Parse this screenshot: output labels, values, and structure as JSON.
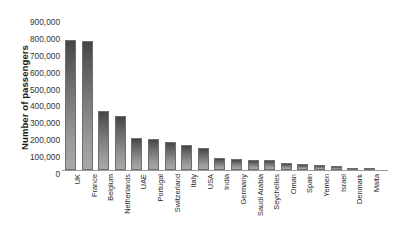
{
  "chart_data": {
    "type": "bar",
    "title": "",
    "xlabel": "",
    "ylabel": "Number of passengers",
    "ylim": [
      0,
      900000
    ],
    "grid": false,
    "legend": false,
    "y_ticks": [
      "0",
      "100,000",
      "200,000",
      "300,000",
      "400,000",
      "500,000",
      "600,000",
      "700,000",
      "800,000",
      "900,000"
    ],
    "y_tick_values": [
      0,
      100000,
      200000,
      300000,
      400000,
      500000,
      600000,
      700000,
      800000,
      900000
    ],
    "categories": [
      "UK",
      "France",
      "Belgium",
      "Netherlands",
      "UAE",
      "Portugal",
      "Switzerland",
      "Italy",
      "USA",
      "India",
      "Germany",
      "Saudi Arabia",
      "Seychelles",
      "Oman",
      "Spain",
      "Yemen",
      "Israel",
      "Denmark",
      "Malta"
    ],
    "values": [
      770000,
      762000,
      352000,
      318000,
      192000,
      182000,
      168000,
      150000,
      128000,
      72000,
      68000,
      62000,
      58000,
      44000,
      35000,
      30000,
      22000,
      12000,
      10000
    ],
    "bar_color_top": "#454545",
    "bar_color_bottom": "#a8a8a8",
    "bar_border_color": "#6e6e6e",
    "axis_color": "#9a9a9a",
    "background": "#ffffff"
  },
  "axis": {
    "y_title": "Number of passengers"
  }
}
